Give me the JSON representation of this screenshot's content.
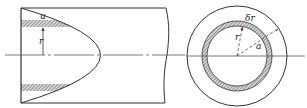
{
  "diagram": {
    "longitudinal_view": {
      "labels": {
        "shell_thickness": "u",
        "radius": "r"
      }
    },
    "cross_section_view": {
      "labels": {
        "shell_thickness": "δr",
        "radius": "r",
        "pipe_radius": "a"
      }
    },
    "colors": {
      "stroke": "#333333",
      "hatch": "#555555",
      "background": "#ffffff"
    }
  }
}
